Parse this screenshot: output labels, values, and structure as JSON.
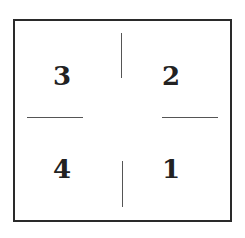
{
  "diagram": {
    "quadrants": [
      {
        "position": "top-left",
        "label": "3"
      },
      {
        "position": "top-right",
        "label": "2"
      },
      {
        "position": "bottom-left",
        "label": "4"
      },
      {
        "position": "bottom-right",
        "label": "1"
      }
    ],
    "colors": {
      "border": "#2a2a2a",
      "divider": "#555555",
      "text": "#222222"
    }
  }
}
